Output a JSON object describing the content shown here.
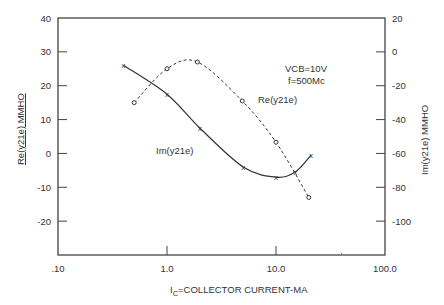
{
  "chart_data": {
    "type": "line",
    "title": "",
    "xlabel": "IC=COLLECTOR CURRENT-MA",
    "xlabel_main": "I",
    "xlabel_sub": "C",
    "xlabel_rest": "=COLLECTOR CURRENT-MA",
    "xscale": "log",
    "xlim": [
      0.1,
      100
    ],
    "x_ticks": [
      ".10",
      "1.0",
      "10.0",
      "100.0"
    ],
    "ylabel_left": "Re(y21e) MMHO",
    "ylim_left": [
      -30,
      40
    ],
    "y_ticks_left": [
      "40",
      "30",
      "20",
      "10",
      "0",
      "-10",
      "-20"
    ],
    "ylabel_right": "Im(y21e) MMHO",
    "ylim_right": [
      -120,
      20
    ],
    "y_ticks_right": [
      "20",
      "0",
      "-20",
      "-40",
      "-60",
      "-80",
      "-100"
    ],
    "grid": false,
    "annotations": {
      "condition_vcb": "VCB=10V",
      "condition_f": "f=500Mc",
      "re_label": "Re(y21e)",
      "im_label": "Im(y21e)"
    },
    "series": [
      {
        "name": "Re(y21e)",
        "axis": "left",
        "style": "dashed",
        "marker": "o",
        "x": [
          0.5,
          1.0,
          1.9,
          4.9,
          10,
          20
        ],
        "y": [
          15,
          25,
          27,
          15.5,
          3.3,
          -13
        ]
      },
      {
        "name": "Im(y21e)",
        "axis": "right",
        "style": "solid",
        "marker": "x",
        "x": [
          0.4,
          1.0,
          2.0,
          5.0,
          10,
          15,
          21
        ],
        "y": [
          -8,
          -25,
          -45,
          -68,
          -74,
          -71,
          -61
        ]
      }
    ]
  }
}
